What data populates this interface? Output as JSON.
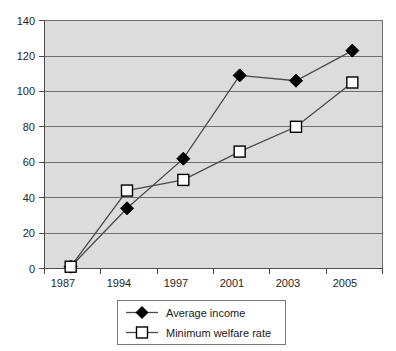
{
  "chart_data": {
    "type": "line",
    "title": "",
    "xlabel": "",
    "ylabel": "",
    "categories": [
      "1987",
      "1994",
      "1997",
      "2001",
      "2003",
      "2005"
    ],
    "ylim": [
      0,
      140
    ],
    "y_ticks": [
      "0",
      "20",
      "40",
      "60",
      "80",
      "100",
      "120",
      "140"
    ],
    "grid": true,
    "legend_position": "bottom",
    "series": [
      {
        "name": "Average income",
        "marker": "filled-diamond",
        "values": [
          1,
          34,
          62,
          109,
          106,
          123
        ]
      },
      {
        "name": "Minimum welfare rate",
        "marker": "open-square",
        "values": [
          1,
          44,
          50,
          66,
          80,
          105
        ]
      }
    ]
  },
  "legend": {
    "entries": [
      {
        "label": "Average income",
        "marker_name": "legend-marker-diamond"
      },
      {
        "label": "Minimum welfare rate",
        "marker_name": "legend-marker-square"
      }
    ]
  },
  "colors": {
    "plot_background": "#dcdcdc",
    "gridline": "#6e6e6e",
    "line": "#4a4a4a",
    "series1_marker": "#000000",
    "series2_marker": "#ffffff",
    "page_background": "#ffffff"
  }
}
